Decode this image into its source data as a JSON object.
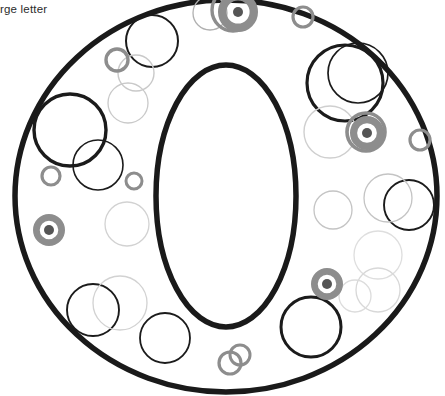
{
  "page": {
    "background_color": "#ffffff",
    "width": 445,
    "height": 396
  },
  "instructions": {
    "line1": "he large letter",
    "line2": "ous",
    "line3": "r on",
    "text_color": "#2b2b2b",
    "note_clipped_left": true
  },
  "letter": {
    "glyph": "O",
    "stroke_color": "#1a1a1a",
    "fill_color": "#ffffff",
    "outer": {
      "cx": 226,
      "cy": 196,
      "rx": 211,
      "ry": 196,
      "stroke_width": 5.5
    },
    "inner": {
      "cx": 226,
      "cy": 196,
      "rx": 70,
      "ry": 131,
      "stroke_width": 5.5
    }
  },
  "palette": {
    "dark": "#1b1b1b",
    "medium_gray": "#8d8d8d",
    "light_gray": "#c9c9c9",
    "very_light_gray": "#dedede",
    "dot_dark": "#555555"
  },
  "chart_data": {
    "type": "scatter",
    "xlabel": "",
    "ylabel": "",
    "xlim": [
      0,
      445
    ],
    "ylim": [
      0,
      396
    ],
    "grid": false,
    "legend": "none",
    "circles": [
      {
        "cx": 152,
        "cy": 41,
        "r": 26,
        "stroke": "#1b1b1b",
        "w": 2.0,
        "tone": "dark"
      },
      {
        "cx": 70,
        "cy": 130,
        "r": 36,
        "stroke": "#1b1b1b",
        "w": 3.4,
        "tone": "dark"
      },
      {
        "cx": 98,
        "cy": 165,
        "r": 25,
        "stroke": "#1b1b1b",
        "w": 1.6,
        "tone": "dark"
      },
      {
        "cx": 345,
        "cy": 83,
        "r": 38,
        "stroke": "#1b1b1b",
        "w": 3.2,
        "tone": "dark"
      },
      {
        "cx": 358,
        "cy": 73,
        "r": 30,
        "stroke": "#1b1b1b",
        "w": 1.7,
        "tone": "dark"
      },
      {
        "cx": 409,
        "cy": 205,
        "r": 25,
        "stroke": "#1b1b1b",
        "w": 1.9,
        "tone": "dark"
      },
      {
        "cx": 93,
        "cy": 310,
        "r": 26,
        "stroke": "#1b1b1b",
        "w": 1.9,
        "tone": "dark"
      },
      {
        "cx": 165,
        "cy": 338,
        "r": 25,
        "stroke": "#1b1b1b",
        "w": 1.8,
        "tone": "dark"
      },
      {
        "cx": 311,
        "cy": 327,
        "r": 30,
        "stroke": "#1b1b1b",
        "w": 3.0,
        "tone": "dark"
      },
      {
        "cx": 136,
        "cy": 73,
        "r": 18,
        "stroke": "#c9c9c9",
        "w": 1.4,
        "tone": "light"
      },
      {
        "cx": 128,
        "cy": 103,
        "r": 20,
        "stroke": "#c9c9c9",
        "w": 1.3,
        "tone": "light"
      },
      {
        "cx": 127,
        "cy": 224,
        "r": 22,
        "stroke": "#d2d2d2",
        "w": 1.3,
        "tone": "light"
      },
      {
        "cx": 120,
        "cy": 303,
        "r": 27,
        "stroke": "#d2d2d2",
        "w": 1.3,
        "tone": "light"
      },
      {
        "cx": 210,
        "cy": 13,
        "r": 17,
        "stroke": "#b0b0b0",
        "w": 1.3,
        "tone": "light"
      },
      {
        "cx": 330,
        "cy": 132,
        "r": 26,
        "stroke": "#cfcfcf",
        "w": 1.4,
        "tone": "light"
      },
      {
        "cx": 333,
        "cy": 210,
        "r": 19,
        "stroke": "#c4c4c4",
        "w": 1.3,
        "tone": "light"
      },
      {
        "cx": 388,
        "cy": 198,
        "r": 24,
        "stroke": "#c4c4c4",
        "w": 1.3,
        "tone": "light"
      },
      {
        "cx": 378,
        "cy": 255,
        "r": 24,
        "stroke": "#dedede",
        "w": 1.3,
        "tone": "light"
      },
      {
        "cx": 378,
        "cy": 290,
        "r": 22,
        "stroke": "#d8d8d8",
        "w": 1.3,
        "tone": "light"
      },
      {
        "cx": 355,
        "cy": 296,
        "r": 16,
        "stroke": "#dcdcdc",
        "w": 1.3,
        "tone": "light"
      },
      {
        "cx": 233,
        "cy": 10,
        "r": 21,
        "stroke": "#8d8d8d",
        "w": 3.4,
        "tone": "medium"
      },
      {
        "cx": 303,
        "cy": 17,
        "r": 10,
        "stroke": "#8d8d8d",
        "w": 3.2,
        "tone": "medium"
      },
      {
        "cx": 117,
        "cy": 60,
        "r": 11,
        "stroke": "#8d8d8d",
        "w": 3.4,
        "tone": "medium"
      },
      {
        "cx": 51,
        "cy": 176,
        "r": 9,
        "stroke": "#8d8d8d",
        "w": 3.2,
        "tone": "medium"
      },
      {
        "cx": 134,
        "cy": 181,
        "r": 8,
        "stroke": "#8d8d8d",
        "w": 3.0,
        "tone": "medium"
      },
      {
        "cx": 420,
        "cy": 140,
        "r": 10,
        "stroke": "#8d8d8d",
        "w": 3.2,
        "tone": "medium"
      },
      {
        "cx": 366,
        "cy": 132,
        "r": 19,
        "stroke": "#8d8d8d",
        "w": 3.6,
        "tone": "medium"
      },
      {
        "cx": 230,
        "cy": 363,
        "r": 11,
        "stroke": "#8d8d8d",
        "w": 3.2,
        "tone": "medium"
      },
      {
        "cx": 240,
        "cy": 355,
        "r": 10,
        "stroke": "#8d8d8d",
        "w": 3.0,
        "tone": "medium"
      }
    ],
    "donuts": [
      {
        "cx": 49,
        "cy": 230,
        "r_outer": 16,
        "r_dot": 5,
        "ring": "#8d8d8d",
        "dot": "#555555"
      },
      {
        "cx": 367,
        "cy": 133,
        "r_outer": 17,
        "r_dot": 5,
        "ring": "#8d8d8d",
        "dot": "#555555"
      },
      {
        "cx": 327,
        "cy": 284,
        "r_outer": 16,
        "r_dot": 5,
        "ring": "#8d8d8d",
        "dot": "#555555"
      },
      {
        "cx": 238,
        "cy": 12,
        "r_outer": 20,
        "r_dot": 5,
        "ring": "#8d8d8d",
        "dot": "#555555"
      }
    ]
  }
}
